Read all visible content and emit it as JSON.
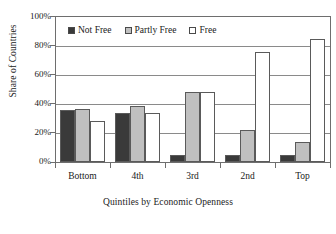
{
  "chart_data": {
    "type": "bar",
    "title": "",
    "xlabel": "Quintiles by Economic Openness",
    "ylabel": "Share of Countries",
    "categories": [
      "Bottom",
      "4th",
      "3rd",
      "2nd",
      "Top"
    ],
    "series": [
      {
        "name": "Not Free",
        "color": "#3a3a3a",
        "values": [
          36.0,
          34.0,
          4.5,
          5.0,
          4.7
        ]
      },
      {
        "name": "Partly Free",
        "color": "#c0c0c0",
        "values": [
          36.5,
          38.5,
          48.5,
          22.0,
          13.5
        ]
      },
      {
        "name": "Free",
        "color": "#ffffff",
        "values": [
          28.5,
          34.0,
          48.5,
          76.0,
          85.0
        ]
      }
    ],
    "ylim": [
      0,
      100
    ],
    "yticks": [
      "0%",
      "20%",
      "40%",
      "60%",
      "80%",
      "100%"
    ],
    "ytick_values": [
      0,
      20,
      40,
      60,
      80,
      100
    ],
    "grid": "horizontal",
    "legend_position": "top-center"
  },
  "legend": {
    "items": [
      {
        "label": "Not Free"
      },
      {
        "label": "Partly Free"
      },
      {
        "label": "Free"
      }
    ]
  }
}
